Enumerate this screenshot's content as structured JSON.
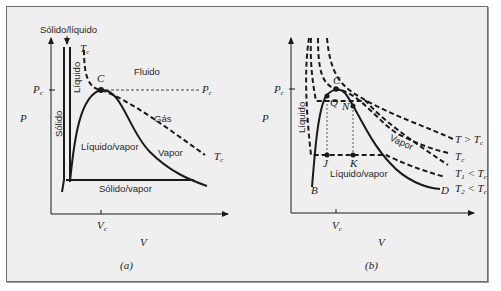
{
  "figure": {
    "panel_a": {
      "caption": "(a)",
      "axis_y": "P",
      "axis_x": "V",
      "tick_y": {
        "main": "P",
        "sub": "c"
      },
      "tick_x": {
        "main": "V",
        "sub": "c"
      },
      "tick_y_right": {
        "main": "P",
        "sub": "c"
      },
      "critical_isotherm": {
        "main": "T",
        "sub": "c"
      },
      "critical_isotherm_end": {
        "main": "T",
        "sub": "c"
      },
      "critical_point": "C",
      "labels": {
        "solid_liquid": "Sólido/líquido",
        "liquid": "Líquido",
        "solid": "Sólido",
        "fluid": "Fluido",
        "gas": "Gás",
        "liquid_vapor": "Líquido/vapor",
        "vapor": "Vapor",
        "solid_vapor": "Sólido/vapor"
      }
    },
    "panel_b": {
      "caption": "(b)",
      "axis_y": "P",
      "axis_x": "V",
      "tick_y": {
        "main": "P",
        "sub": "c"
      },
      "tick_x": {
        "main": "V",
        "sub": "c"
      },
      "critical_point": "C",
      "points": [
        "Q",
        "N",
        "J",
        "K",
        "B",
        "D"
      ],
      "labels": {
        "liquid": "Líquido",
        "vapor": "Vapor",
        "liquid_vapor": "Líquido/vapor"
      },
      "isotherms": [
        {
          "label": "T > T",
          "sub": "c"
        },
        {
          "label": "T",
          "sub": "c"
        },
        {
          "label": "T",
          "sub1": "1",
          "rel": " < T",
          "sub": "c"
        },
        {
          "label": "T",
          "sub1": "2",
          "rel": " < T",
          "sub": "c"
        }
      ]
    }
  }
}
